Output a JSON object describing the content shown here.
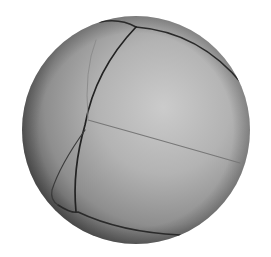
{
  "image": {
    "subject": "grayscale sphere with curved panel seams",
    "background_color": "#ffffff",
    "sphere": {
      "cx": 136,
      "cy": 130,
      "r": 114,
      "highlight_color": "#c8c8c8",
      "mid_color": "#a6a6a6",
      "shadow_color": "#5a5a5a",
      "seam_color": "#2a2a2a",
      "faint_seam_color": "#777777"
    }
  }
}
